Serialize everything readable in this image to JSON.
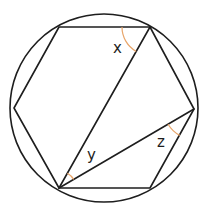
{
  "diagram": {
    "title": "",
    "colors": {
      "line": "#1e1e1e",
      "arc": "#e8a56a",
      "background": "#ffffff"
    },
    "circle": {
      "cx": 104,
      "cy": 108,
      "r": 94
    },
    "hexagon_vertices": [
      {
        "id": "top-left",
        "x": 59,
        "y": 27
      },
      {
        "id": "top-right",
        "x": 150,
        "y": 27
      },
      {
        "id": "right",
        "x": 194,
        "y": 109
      },
      {
        "id": "bottom-right",
        "x": 150,
        "y": 188
      },
      {
        "id": "bottom-left",
        "x": 59,
        "y": 188
      },
      {
        "id": "left",
        "x": 14,
        "y": 108
      }
    ],
    "diagonals": [
      {
        "from": "bottom-left",
        "to": "top-right"
      },
      {
        "from": "bottom-left",
        "to": "right"
      }
    ],
    "angles": [
      {
        "label": "x",
        "vertex": "top-right",
        "between": [
          "top-left",
          "bottom-left"
        ]
      },
      {
        "label": "y",
        "vertex": "bottom-left",
        "between": [
          "top-right",
          "right"
        ]
      },
      {
        "label": "z",
        "vertex": "right",
        "between": [
          "bottom-left",
          "bottom-right"
        ]
      }
    ],
    "labels": {
      "x": "x",
      "y": "y",
      "z": "z"
    }
  }
}
